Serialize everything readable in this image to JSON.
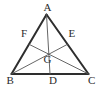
{
  "figure": {
    "background_color": "#ffffff",
    "stroke_color": "#3a3a3a",
    "side_stroke_color": "#2e2e2e",
    "cevian_stroke_color": "#555555",
    "label_color": "#2b2b2b",
    "side_stroke_width": 2,
    "cevian_stroke_width": 0.9
  },
  "points": {
    "A": {
      "label": "A",
      "x": 46.5,
      "y": 14.5,
      "label_x": 43.5,
      "label_y": 2
    },
    "B": {
      "label": "B",
      "x": 11.5,
      "y": 74.0,
      "label_x": 6.5,
      "label_y": 75
    },
    "C": {
      "label": "C",
      "x": 88.5,
      "y": 74.0,
      "label_x": 88.0,
      "label_y": 75
    },
    "D": {
      "label": "D",
      "x": 50.0,
      "y": 74.0,
      "label_x": 49.0,
      "label_y": 75
    },
    "E": {
      "label": "E",
      "x": 67.5,
      "y": 44.3,
      "label_x": 68.5,
      "label_y": 28
    },
    "F": {
      "label": "F",
      "x": 29.0,
      "y": 44.3,
      "label_x": 21.0,
      "label_y": 28
    },
    "G": {
      "label": "G",
      "x": 48.8,
      "y": 54.2,
      "label_x": 43.5,
      "label_y": 54
    }
  },
  "segments": [
    {
      "name": "side-ab",
      "from": "A",
      "to": "B",
      "kind": "side"
    },
    {
      "name": "side-ac",
      "from": "A",
      "to": "C",
      "kind": "side"
    },
    {
      "name": "side-bc",
      "from": "B",
      "to": "C",
      "kind": "side"
    },
    {
      "name": "median-ad",
      "from": "A",
      "to": "D",
      "kind": "cevian"
    },
    {
      "name": "median-be",
      "from": "B",
      "to": "E",
      "kind": "cevian"
    },
    {
      "name": "median-cf",
      "from": "C",
      "to": "F",
      "kind": "cevian"
    }
  ]
}
